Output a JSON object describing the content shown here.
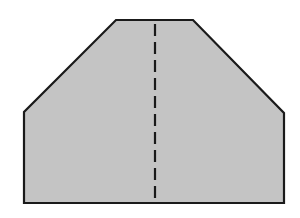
{
  "diagram": {
    "type": "geometric-shape",
    "shape": "hexagon (pentagon-like with chamfered top corners)",
    "fill_color": "#c4c4c4",
    "stroke_color": "#1a1a1a",
    "background_color": "#ffffff",
    "outline_points": [
      [
        24,
        203
      ],
      [
        24,
        112
      ],
      [
        116,
        20
      ],
      [
        193,
        20
      ],
      [
        284,
        113
      ],
      [
        284,
        203
      ]
    ],
    "fold_line": {
      "style": "dashed",
      "x": 155,
      "y_start": 24,
      "y_end": 203,
      "dash_length": 12,
      "gap_length": 6
    }
  }
}
